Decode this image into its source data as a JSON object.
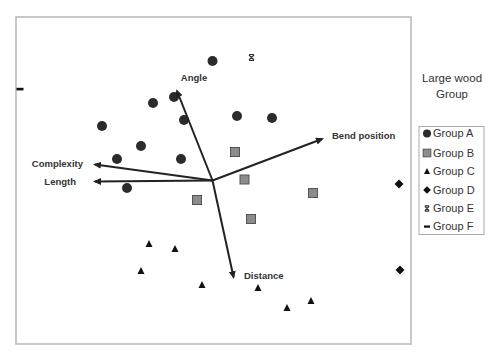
{
  "chart_data": {
    "type": "scatter",
    "subtype": "biplot",
    "title": "",
    "xlabel": "",
    "ylabel": "",
    "grid": false,
    "frame": {
      "x0": 16,
      "y0": 17,
      "x1": 411,
      "y1": 344
    },
    "legend": {
      "position": "right",
      "title_lines": [
        "Large wood",
        "Group"
      ],
      "entries": [
        {
          "label": "Group A",
          "marker": "circle"
        },
        {
          "label": "Group B",
          "marker": "square"
        },
        {
          "label": "Group C",
          "marker": "triangle"
        },
        {
          "label": "Group D",
          "marker": "diamond"
        },
        {
          "label": "Group E",
          "marker": "x"
        },
        {
          "label": "Group F",
          "marker": "dash"
        }
      ]
    },
    "vectors": {
      "origin": {
        "x": 212.5,
        "y": 180.5
      },
      "items": [
        {
          "label": "Angle",
          "tip": {
            "x": 177,
            "y": 91
          },
          "label_pos": {
            "x": 194,
            "y": 81,
            "anchor": "middle"
          }
        },
        {
          "label": "Bend position",
          "tip": {
            "x": 322,
            "y": 139
          },
          "label_pos": {
            "x": 332,
            "y": 139,
            "anchor": "start"
          }
        },
        {
          "label": "Complexity",
          "tip": {
            "x": 95,
            "y": 164.5
          },
          "label_pos": {
            "x": 83,
            "y": 167,
            "anchor": "end"
          }
        },
        {
          "label": "Length",
          "tip": {
            "x": 95,
            "y": 181.5
          },
          "label_pos": {
            "x": 76,
            "y": 185,
            "anchor": "end"
          }
        },
        {
          "label": "Distance",
          "tip": {
            "x": 233.5,
            "y": 277
          },
          "label_pos": {
            "x": 244,
            "y": 279,
            "anchor": "start"
          }
        }
      ]
    },
    "series": [
      {
        "name": "Group A",
        "marker": "circle",
        "color": "#2b2b2b",
        "points": [
          [
            212.5,
            61
          ],
          [
            153,
            103
          ],
          [
            174,
            97
          ],
          [
            184,
            120
          ],
          [
            102,
            126
          ],
          [
            141,
            146
          ],
          [
            117,
            159
          ],
          [
            181,
            159
          ],
          [
            237,
            116
          ],
          [
            272,
            118
          ],
          [
            127,
            188
          ]
        ]
      },
      {
        "name": "Group B",
        "marker": "square",
        "color": "#8c8c8c",
        "points": [
          [
            235,
            152
          ],
          [
            244.5,
            179.5
          ],
          [
            313,
            193
          ],
          [
            197,
            200
          ],
          [
            251,
            219
          ]
        ]
      },
      {
        "name": "Group C",
        "marker": "triangle",
        "color": "#111111",
        "points": [
          [
            149,
            244
          ],
          [
            175,
            249
          ],
          [
            141,
            271
          ],
          [
            202,
            285
          ],
          [
            258,
            288
          ],
          [
            287,
            308
          ],
          [
            311,
            301
          ]
        ]
      },
      {
        "name": "Group D",
        "marker": "diamond",
        "color": "#111111",
        "points": [
          [
            399,
            184
          ],
          [
            400,
            270
          ]
        ]
      },
      {
        "name": "Group E",
        "marker": "x",
        "color": "#333333",
        "points": [
          [
            251.5,
            57.5
          ]
        ]
      },
      {
        "name": "Group F",
        "marker": "dash",
        "color": "#111111",
        "points": [
          [
            20,
            89
          ]
        ]
      }
    ]
  }
}
